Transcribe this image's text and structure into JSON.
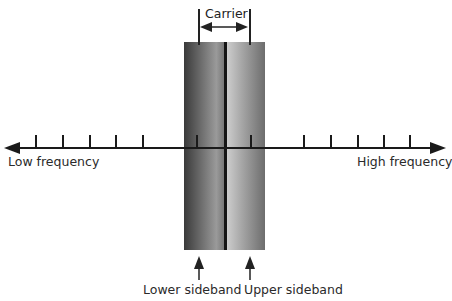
{
  "diagram": {
    "carrier_label": "Carrier",
    "axis": {
      "left_label": "Low frequency",
      "right_label": "High frequency"
    },
    "sidebands": {
      "lower_label": "Lower sideband",
      "upper_label": "Upper sideband"
    }
  }
}
